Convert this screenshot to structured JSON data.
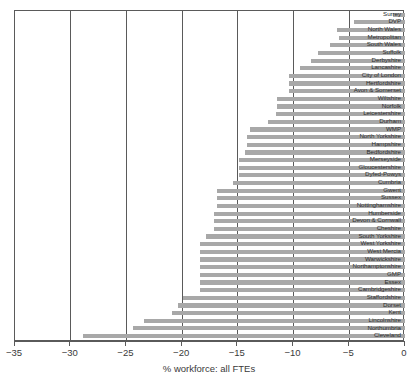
{
  "chart_data": {
    "type": "bar",
    "orientation": "horizontal",
    "title": "",
    "xlabel": "% workforce: all FTEs",
    "ylabel": "",
    "xlim": [
      -35,
      0
    ],
    "xticks": [
      -35,
      -30,
      -25,
      -20,
      -15,
      -10,
      -5,
      0
    ],
    "xticklabels": [
      "−35",
      "−30",
      "−25",
      "−20",
      "−15",
      "−10",
      "−5",
      "0"
    ],
    "grid": "vertical",
    "legend": null,
    "bar_color": "#a8a8a8",
    "categories": [
      "Surrey",
      "DVP",
      "North Wales",
      "Metropolitan",
      "South Wales",
      "Suffolk",
      "Derbyshire",
      "Lancashire",
      "City of London",
      "Hertfordshire",
      "Avon & Somerset",
      "Wiltshire",
      "Norfolk",
      "Leicestershire",
      "Durham",
      "WMP",
      "North Yorkshire",
      "Hampshire",
      "Bedfordshire",
      "Merseyside",
      "Gloucestershire",
      "Dyfed-Powys",
      "Cumbria",
      "Gwent",
      "Sussex",
      "Nottinghamshire",
      "Humberside",
      "Devon & Cornwall",
      "Cheshire",
      "South Yorkshire",
      "West Yorkshire",
      "West Mercia",
      "Warwickshire",
      "Northamptonshire",
      "GMP",
      "Essex",
      "Cambridgeshire",
      "Staffordshire",
      "Dorset",
      "Kent",
      "Lincolnshire",
      "Northumbria",
      "Cleveland"
    ],
    "values": [
      -1.1,
      -4.6,
      -6.1,
      -5.9,
      -6.7,
      -7.8,
      -8.4,
      -9.4,
      -10.4,
      -10.4,
      -10.4,
      -11.5,
      -11.5,
      -11.6,
      -12.3,
      -13.9,
      -14.2,
      -14.2,
      -14.4,
      -14.9,
      -14.9,
      -14.9,
      -15.4,
      -16.9,
      -16.9,
      -16.9,
      -17.1,
      -17.1,
      -17.1,
      -17.9,
      -18.4,
      -18.4,
      -18.4,
      -18.4,
      -18.4,
      -18.4,
      -18.4,
      -19.9,
      -20.4,
      -20.9,
      -23.4,
      -24.4,
      -28.9
    ]
  }
}
